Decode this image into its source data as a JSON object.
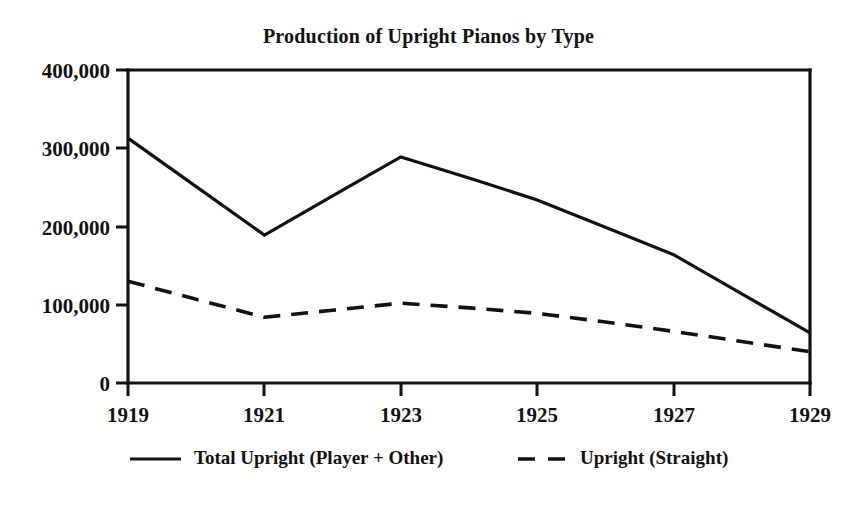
{
  "chart_data": {
    "type": "line",
    "title": "Production of Upright Pianos by Type",
    "xlabel": "",
    "ylabel": "",
    "x": [
      1919,
      1920,
      1921,
      1922,
      1923,
      1924,
      1925,
      1926,
      1927,
      1928,
      1929
    ],
    "xlim": [
      1919,
      1929
    ],
    "ylim": [
      0,
      400000
    ],
    "grid": false,
    "legend_position": "below",
    "xticks": [
      1919,
      1921,
      1923,
      1925,
      1927,
      1929
    ],
    "xtick_labels": [
      "1919",
      "1921",
      "1923",
      "1925",
      "1927",
      "1929"
    ],
    "yticks": [
      0,
      100000,
      200000,
      300000,
      400000
    ],
    "ytick_labels": [
      "0",
      "100,000",
      "200,000",
      "300,000",
      "400,000"
    ],
    "series": [
      {
        "name": "Total Upright (Player + Other)",
        "style": "solid",
        "color": "#111111",
        "values": [
          313000,
          251000,
          189000,
          239000,
          289000,
          262000,
          234000,
          199000,
          164000,
          114000,
          64000
        ]
      },
      {
        "name": "Upright (Straight)",
        "style": "dashed",
        "color": "#111111",
        "values": [
          130000,
          107000,
          84000,
          93000,
          102000,
          96000,
          89000,
          78000,
          66000,
          53000,
          40000
        ]
      }
    ]
  },
  "legend": {
    "entries": [
      {
        "label": "Total Upright (Player + Other)",
        "style": "solid"
      },
      {
        "label": "Upright (Straight)",
        "style": "dashed"
      }
    ]
  },
  "axes": {
    "y_labels": [
      "400,000",
      "300,000",
      "200,000",
      "100,000",
      "0"
    ],
    "x_labels": [
      "1919",
      "1921",
      "1923",
      "1925",
      "1927",
      "1929"
    ]
  }
}
